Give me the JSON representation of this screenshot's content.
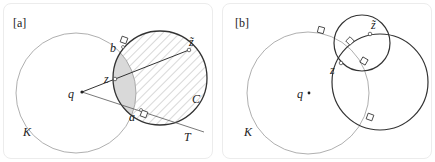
{
  "panels": [
    {
      "tag": "[a]",
      "labels": {
        "q": "q",
        "z": "z",
        "z_tilde": "z̃",
        "b": "b",
        "a": "a",
        "C": "C",
        "K": "K",
        "T": "T"
      }
    },
    {
      "tag": "[b]",
      "labels": {
        "q": "q",
        "z": "z",
        "z_tilde": "z̃",
        "K": "K"
      }
    }
  ],
  "colors": {
    "thin_circle": "#9a9a9a",
    "thick_circle": "#333333",
    "lens_fill": "#d9d9d9",
    "hatch": "#9a9a9a",
    "panel_border": "#ececec"
  }
}
